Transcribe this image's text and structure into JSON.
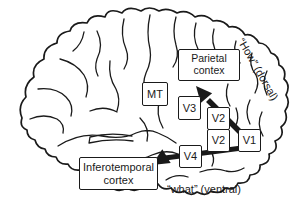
{
  "figure": {
    "type": "brain-visual-pathways-diagram",
    "background_color": "#ffffff",
    "ink_color": "#1a1a1a",
    "boxes": {
      "parietal": {
        "line1": "Parietal",
        "line2": "contex"
      },
      "mt": {
        "label": "MT"
      },
      "v3": {
        "label": "V3"
      },
      "v2_upper": {
        "label": "V2"
      },
      "v2_lower": {
        "label": "V2"
      },
      "v1": {
        "label": "V1"
      },
      "v4": {
        "label": "V4"
      },
      "inferotemporal": {
        "line1": "Inferotemporal",
        "line2": "cortex"
      }
    },
    "labels": {
      "dorsal": "“How” (dorsal)",
      "ventral": "“what” (ventral)"
    },
    "arrows": [
      {
        "name": "dorsal-stream-arrow",
        "from": "V1 / V2",
        "to": "Parietal contex"
      },
      {
        "name": "ventral-stream-arrow",
        "from": "V1 / V2",
        "to": "Inferotemporal cortex"
      }
    ]
  }
}
